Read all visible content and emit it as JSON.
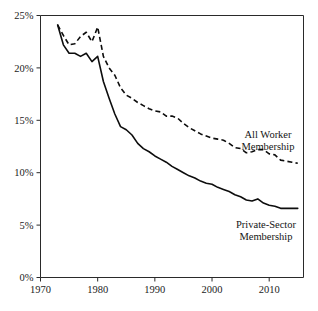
{
  "chart_data": {
    "type": "line",
    "title": "",
    "subtitle": "",
    "xlabel": "",
    "ylabel": "",
    "xlim": [
      1970,
      2016
    ],
    "ylim": [
      0,
      25
    ],
    "grid": false,
    "legend_position": "inline-annotation",
    "x_ticks": [
      "1970",
      "1980",
      "1990",
      "2000",
      "2010"
    ],
    "x_tick_values": [
      1970,
      1980,
      1990,
      2000,
      2010
    ],
    "y_ticks": [
      "0%",
      "5%",
      "10%",
      "15%",
      "20%",
      "25%"
    ],
    "y_tick_values": [
      0,
      5,
      10,
      15,
      20,
      25
    ],
    "x": [
      1973,
      1974,
      1975,
      1976,
      1977,
      1978,
      1979,
      1980,
      1981,
      1982,
      1983,
      1984,
      1985,
      1986,
      1987,
      1988,
      1989,
      1990,
      1991,
      1992,
      1993,
      1994,
      1995,
      1996,
      1997,
      1998,
      1999,
      2000,
      2001,
      2002,
      2003,
      2004,
      2005,
      2006,
      2007,
      2008,
      2009,
      2010,
      2011,
      2012,
      2013,
      2014,
      2015
    ],
    "series": [
      {
        "name": "All Worker Membership",
        "style": "dashed",
        "color": "#0d0d0d",
        "label_text": [
          "All Worker",
          "Membership"
        ],
        "values": [
          24.1,
          23.1,
          22.2,
          22.3,
          23.0,
          23.4,
          22.5,
          23.9,
          21.1,
          20.0,
          19.3,
          18.1,
          17.4,
          17.1,
          16.7,
          16.4,
          16.1,
          15.9,
          15.8,
          15.4,
          15.4,
          15.2,
          14.7,
          14.3,
          14.0,
          13.7,
          13.5,
          13.3,
          13.2,
          13.1,
          12.8,
          12.4,
          12.3,
          11.9,
          12.0,
          12.2,
          12.2,
          11.8,
          11.7,
          11.2,
          11.1,
          11.0,
          10.9
        ]
      },
      {
        "name": "Private-Sector Membership",
        "style": "solid",
        "color": "#0d0d0d",
        "label_text": [
          "Private-Sector",
          "Membership"
        ],
        "values": [
          24.1,
          22.2,
          21.4,
          21.4,
          21.1,
          21.4,
          20.6,
          21.1,
          18.7,
          17.1,
          15.6,
          14.4,
          14.1,
          13.6,
          12.8,
          12.3,
          12.0,
          11.6,
          11.3,
          11.0,
          10.6,
          10.3,
          10.0,
          9.7,
          9.5,
          9.2,
          9.0,
          8.9,
          8.6,
          8.4,
          8.2,
          7.9,
          7.7,
          7.4,
          7.3,
          7.5,
          7.1,
          6.9,
          6.8,
          6.6,
          6.6,
          6.6,
          6.6
        ]
      }
    ],
    "annotations": [
      {
        "text": "All Worker Membership",
        "x_frac": 0.845,
        "y_px_line1": 134,
        "y_px_line2": 146
      },
      {
        "text": "Private-Sector Membership",
        "x_frac": 0.838,
        "y_px_line1": 224,
        "y_px_line2": 236
      }
    ]
  },
  "axes": {
    "y_labels": [
      "25%",
      "20%",
      "15%",
      "10%",
      "5%",
      "0%"
    ],
    "x_labels": [
      "1970",
      "1980",
      "1990",
      "2000",
      "2010"
    ]
  },
  "labels": {
    "all_worker_line1": "All Worker",
    "all_worker_line2": "Membership",
    "private_line1": "Private-Sector",
    "private_line2": "Membership"
  }
}
